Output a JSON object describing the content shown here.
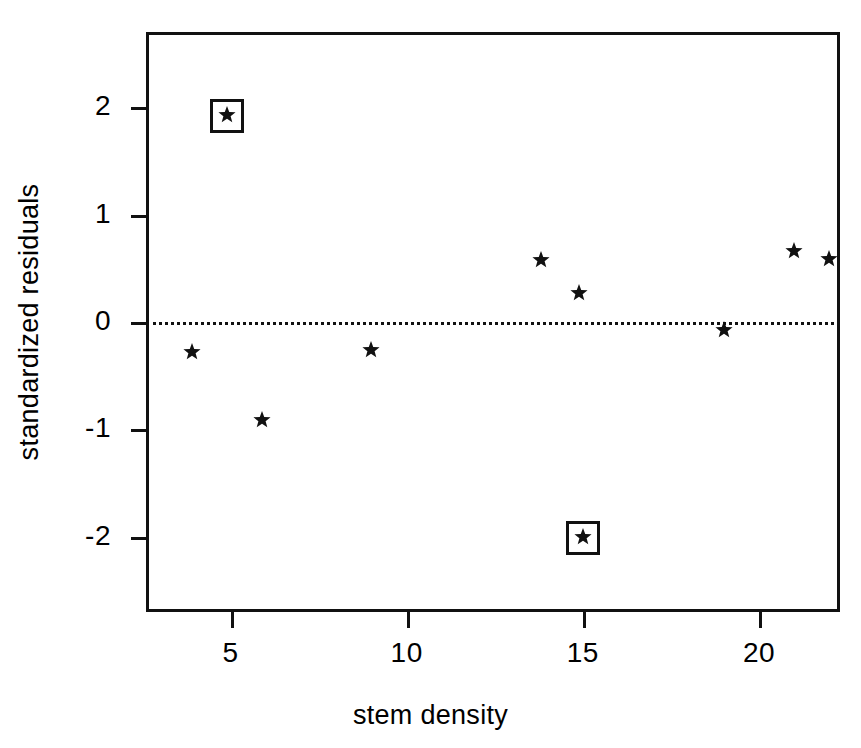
{
  "chart_data": {
    "type": "scatter",
    "title": "",
    "xlabel": "stem density",
    "ylabel": "standardized residuals",
    "xlim": [
      2.6,
      22.3
    ],
    "ylim": [
      -2.7,
      2.7
    ],
    "xticks": [
      5,
      10,
      15,
      20
    ],
    "yticks": [
      2,
      1,
      0,
      -1,
      -2
    ],
    "xticklabels": [
      "5",
      "10",
      "15",
      "20"
    ],
    "yticklabels": [
      "2",
      "1",
      "0",
      "-1",
      "-2"
    ],
    "grid": false,
    "legend": null,
    "marker": "star",
    "reference_lines": [
      {
        "orientation": "horizontal",
        "y": 0,
        "style": "dotted"
      }
    ],
    "points": [
      {
        "x": 4.9,
        "y": 1.91,
        "highlighted": true,
        "label": "outlier-high"
      },
      {
        "x": 3.9,
        "y": -0.3,
        "highlighted": false,
        "label": ""
      },
      {
        "x": 5.9,
        "y": -0.93,
        "highlighted": false,
        "label": ""
      },
      {
        "x": 9.0,
        "y": -0.28,
        "highlighted": false,
        "label": ""
      },
      {
        "x": 13.8,
        "y": 0.56,
        "highlighted": false,
        "label": ""
      },
      {
        "x": 14.9,
        "y": 0.25,
        "highlighted": false,
        "label": ""
      },
      {
        "x": 15.0,
        "y": -2.02,
        "highlighted": true,
        "label": "outlier-low"
      },
      {
        "x": 19.0,
        "y": -0.09,
        "highlighted": false,
        "label": ""
      },
      {
        "x": 21.0,
        "y": 0.64,
        "highlighted": false,
        "label": ""
      },
      {
        "x": 22.0,
        "y": 0.57,
        "highlighted": false,
        "label": ""
      }
    ]
  },
  "colors": {
    "axis": "#111111",
    "marker": "#111111",
    "background": "#ffffff",
    "reference_line": "#111111"
  }
}
